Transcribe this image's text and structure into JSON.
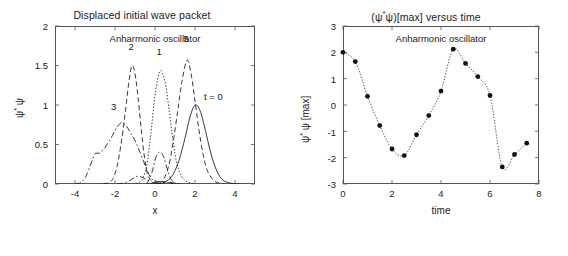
{
  "figure": {
    "background": "#ffffff",
    "axis_color": "#555555",
    "curve_color": "#222222",
    "marker_color": "#111111"
  },
  "left_panel": {
    "title": "Displaced initial wave packet",
    "annotation": "Anharmonic oscillator",
    "xlabel": "x",
    "ylabel_psi": "ψ",
    "ylabel_star": "*",
    "ylabel_psi2": "ψ",
    "xticks": [
      "-4",
      "-2",
      "0",
      "2",
      "4"
    ],
    "yticks": [
      "0",
      "0.5",
      "1",
      "1.5",
      "2"
    ],
    "curve_labels": [
      {
        "text": "t = 0",
        "x": 2.55,
        "y": 1.02
      },
      {
        "text": "1",
        "x": 0.22,
        "y": 1.6
      },
      {
        "text": "2",
        "x": -1.18,
        "y": 1.66
      },
      {
        "text": "3",
        "x": -2.05,
        "y": 0.9
      },
      {
        "text": "5",
        "x": 1.58,
        "y": 1.76
      }
    ]
  },
  "right_panel": {
    "title_open": "(",
    "title_psi": "ψ",
    "title_star": "*",
    "title_psi2": "ψ",
    "title_rest": ")[max] versus time",
    "annotation": "Anharmonic oscillator",
    "xlabel": "time",
    "ylabel_psi": "ψ",
    "ylabel_star": "*",
    "ylabel_psi2": "ψ [max]",
    "xticks": [
      "0",
      "2",
      "4",
      "6",
      "8"
    ],
    "yticks": [
      "3",
      "2",
      "1",
      "0",
      "-1",
      "-2",
      "-3"
    ]
  },
  "chart_data": [
    {
      "type": "line",
      "title": "Displaced initial wave packet",
      "subtitle": "Anharmonic oscillator",
      "xlabel": "x",
      "ylabel": "psi* psi",
      "xlim": [
        -5,
        5
      ],
      "ylim": [
        0,
        2
      ],
      "xticks": [
        -4,
        -2,
        0,
        2,
        4
      ],
      "yticks": [
        0,
        0.5,
        1,
        1.5,
        2
      ],
      "grid": false,
      "legend": "inline-curve-labels",
      "series": [
        {
          "name": "t = 0",
          "style": "solid",
          "peak_x": 2.0,
          "peak_y": 1.0,
          "points": [
            [
              -0.4,
              0.0
            ],
            [
              0.0,
              0.002
            ],
            [
              0.3,
              0.01
            ],
            [
              0.6,
              0.04
            ],
            [
              0.9,
              0.12
            ],
            [
              1.2,
              0.3
            ],
            [
              1.5,
              0.58
            ],
            [
              1.75,
              0.85
            ],
            [
              2.0,
              1.0
            ],
            [
              2.25,
              0.93
            ],
            [
              2.5,
              0.7
            ],
            [
              2.8,
              0.38
            ],
            [
              3.1,
              0.16
            ],
            [
              3.4,
              0.05
            ],
            [
              3.8,
              0.01
            ],
            [
              4.3,
              0.0
            ]
          ]
        },
        {
          "name": "1",
          "style": "dotted",
          "peak_x": 0.25,
          "peak_y": 1.43,
          "points": [
            [
              -1.1,
              0.0
            ],
            [
              -0.8,
              0.02
            ],
            [
              -0.6,
              0.08
            ],
            [
              -0.4,
              0.25
            ],
            [
              -0.2,
              0.65
            ],
            [
              0.0,
              1.12
            ],
            [
              0.25,
              1.43
            ],
            [
              0.5,
              1.3
            ],
            [
              0.7,
              0.95
            ],
            [
              0.9,
              0.55
            ],
            [
              1.1,
              0.25
            ],
            [
              1.35,
              0.09
            ],
            [
              1.6,
              0.03
            ],
            [
              2.0,
              0.0
            ]
          ]
        },
        {
          "name": "2",
          "style": "dashed",
          "peak_x": -1.15,
          "peak_y": 1.5,
          "points": [
            [
              -2.6,
              0.0
            ],
            [
              -2.3,
              0.02
            ],
            [
              -2.1,
              0.07
            ],
            [
              -1.9,
              0.22
            ],
            [
              -1.7,
              0.5
            ],
            [
              -1.5,
              0.88
            ],
            [
              -1.3,
              1.3
            ],
            [
              -1.15,
              1.5
            ],
            [
              -1.0,
              1.4
            ],
            [
              -0.85,
              1.1
            ],
            [
              -0.7,
              0.72
            ],
            [
              -0.55,
              0.38
            ],
            [
              -0.4,
              0.15
            ],
            [
              -0.25,
              0.06
            ],
            [
              0.0,
              0.02
            ],
            [
              0.4,
              0.03
            ],
            [
              0.8,
              0.02
            ],
            [
              1.3,
              0.0
            ]
          ]
        },
        {
          "name": "3",
          "style": "dash-dot",
          "peak_x": -1.65,
          "peak_y": 0.78,
          "points": [
            [
              -4.0,
              0.0
            ],
            [
              -3.7,
              0.02
            ],
            [
              -3.45,
              0.1
            ],
            [
              -3.2,
              0.26
            ],
            [
              -3.0,
              0.38
            ],
            [
              -2.8,
              0.39
            ],
            [
              -2.6,
              0.43
            ],
            [
              -2.4,
              0.5
            ],
            [
              -2.2,
              0.58
            ],
            [
              -2.0,
              0.68
            ],
            [
              -1.8,
              0.75
            ],
            [
              -1.65,
              0.78
            ],
            [
              -1.45,
              0.74
            ],
            [
              -1.25,
              0.66
            ],
            [
              -1.0,
              0.55
            ],
            [
              -0.75,
              0.4
            ],
            [
              -0.5,
              0.24
            ],
            [
              -0.3,
              0.12
            ],
            [
              -0.1,
              0.05
            ],
            [
              0.2,
              0.03
            ],
            [
              0.6,
              0.02
            ],
            [
              1.0,
              0.0
            ]
          ]
        },
        {
          "name": "5",
          "style": "dashed",
          "peak_x": 1.6,
          "peak_y": 1.57,
          "points": [
            [
              0.15,
              0.0
            ],
            [
              0.35,
              0.04
            ],
            [
              0.55,
              0.12
            ],
            [
              0.75,
              0.3
            ],
            [
              0.95,
              0.6
            ],
            [
              1.15,
              0.95
            ],
            [
              1.35,
              1.3
            ],
            [
              1.6,
              1.57
            ],
            [
              1.8,
              1.4
            ],
            [
              2.0,
              1.05
            ],
            [
              2.2,
              0.68
            ],
            [
              2.4,
              0.38
            ],
            [
              2.6,
              0.18
            ],
            [
              2.85,
              0.07
            ],
            [
              3.1,
              0.02
            ],
            [
              3.5,
              0.0
            ]
          ]
        },
        {
          "name": "small-central-bump",
          "style": "dash-dot",
          "peak_x": 0.25,
          "peak_y": 0.4,
          "points": [
            [
              -0.45,
              0.0
            ],
            [
              -0.3,
              0.05
            ],
            [
              -0.15,
              0.15
            ],
            [
              0.0,
              0.3
            ],
            [
              0.15,
              0.39
            ],
            [
              0.3,
              0.4
            ],
            [
              0.45,
              0.33
            ],
            [
              0.6,
              0.2
            ],
            [
              0.75,
              0.09
            ],
            [
              0.9,
              0.03
            ],
            [
              1.1,
              0.0
            ]
          ]
        },
        {
          "name": "low-baseline-bump",
          "style": "dash-dot",
          "peak_x": -0.85,
          "peak_y": 0.1,
          "points": [
            [
              -1.9,
              0.0
            ],
            [
              -1.6,
              0.01
            ],
            [
              -1.35,
              0.03
            ],
            [
              -1.1,
              0.07
            ],
            [
              -0.85,
              0.1
            ],
            [
              -0.6,
              0.08
            ],
            [
              -0.4,
              0.05
            ],
            [
              -0.15,
              0.02
            ],
            [
              0.1,
              0.01
            ],
            [
              0.5,
              0.0
            ]
          ]
        }
      ]
    },
    {
      "type": "line",
      "marker": "filled-circle",
      "title": "(psi* psi)[max] versus time",
      "subtitle": "Anharmonic oscillator",
      "xlabel": "time",
      "ylabel": "psi* psi [max]",
      "xlim": [
        0,
        8
      ],
      "ylim": [
        -3,
        3
      ],
      "xticks": [
        0,
        2,
        4,
        6,
        8
      ],
      "yticks": [
        3,
        2,
        1,
        0,
        -1,
        -2,
        -3
      ],
      "grid": false,
      "x": [
        0,
        0.5,
        1.0,
        1.5,
        2.0,
        2.5,
        3.0,
        3.5,
        4.0,
        4.5,
        5.0,
        5.5,
        6.0,
        6.5,
        7.0,
        7.5
      ],
      "values": [
        2.0,
        1.65,
        0.33,
        -0.78,
        -1.67,
        -1.92,
        -1.13,
        -0.4,
        0.53,
        2.12,
        1.58,
        1.08,
        0.36,
        -2.35,
        -1.88,
        -1.45
      ]
    }
  ]
}
